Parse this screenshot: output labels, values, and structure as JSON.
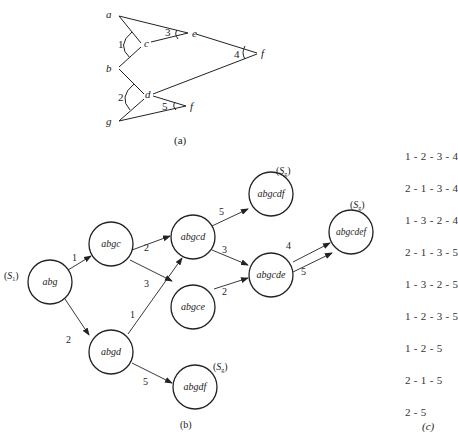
{
  "part_a": {
    "caption": "(a)",
    "points": {
      "a": {
        "label": "a",
        "x": 113,
        "y": 15
      },
      "c": {
        "label": "c",
        "x": 143,
        "y": 43
      },
      "e": {
        "label": "e",
        "x": 190,
        "y": 33
      },
      "f_top": {
        "label": "f",
        "x": 258,
        "y": 53
      },
      "b": {
        "label": "b",
        "x": 113,
        "y": 68
      },
      "d": {
        "label": "d",
        "x": 147,
        "y": 95
      },
      "f_bottom": {
        "label": "f",
        "x": 188,
        "y": 106
      },
      "g": {
        "label": "g",
        "x": 113,
        "y": 121
      }
    },
    "angle_labels": [
      "1",
      "2",
      "3",
      "4",
      "5"
    ]
  },
  "part_b": {
    "caption": "(b)",
    "start_label": "(S1)",
    "goal_label": "(Sg)",
    "nodes": [
      {
        "id": "abg",
        "label": "abg"
      },
      {
        "id": "abgc",
        "label": "abgc"
      },
      {
        "id": "abgd",
        "label": "abgd"
      },
      {
        "id": "abgcd",
        "label": "abgcd"
      },
      {
        "id": "abgce",
        "label": "abgce"
      },
      {
        "id": "abgcdf",
        "label": "abgcdf"
      },
      {
        "id": "abgcde",
        "label": "abgcde"
      },
      {
        "id": "abgcdef",
        "label": "abgcdef"
      },
      {
        "id": "abgdf",
        "label": "abgdf"
      }
    ],
    "edges": [
      {
        "from": "abg",
        "to": "abgc",
        "label": "1"
      },
      {
        "from": "abg",
        "to": "abgd",
        "label": "2"
      },
      {
        "from": "abgc",
        "to": "abgcd",
        "label": "2"
      },
      {
        "from": "abgc",
        "to": "abgce",
        "label": "3"
      },
      {
        "from": "abgd",
        "to": "abgcd",
        "label": "1"
      },
      {
        "from": "abgd",
        "to": "abgdf",
        "label": "5"
      },
      {
        "from": "abgcd",
        "to": "abgcdf",
        "label": "5"
      },
      {
        "from": "abgcd",
        "to": "abgcde",
        "label": "3"
      },
      {
        "from": "abgce",
        "to": "abgcde",
        "label": "2"
      },
      {
        "from": "abgcde",
        "to": "abgcdef",
        "label": "4"
      },
      {
        "from": "abgcde",
        "to": "abgcdef",
        "label": "5"
      }
    ]
  },
  "part_c": {
    "caption": "(c)",
    "sequences": [
      "1 - 2 - 3 - 4",
      "2 - 1 - 3 - 4",
      "1 - 3 - 2 - 4",
      "2 - 1 - 3 - 5",
      "1 - 3 - 2 - 5",
      "1 - 2 - 3 - 5",
      "1 - 2 - 5",
      "2 - 1 - 5",
      "2 - 5"
    ]
  }
}
